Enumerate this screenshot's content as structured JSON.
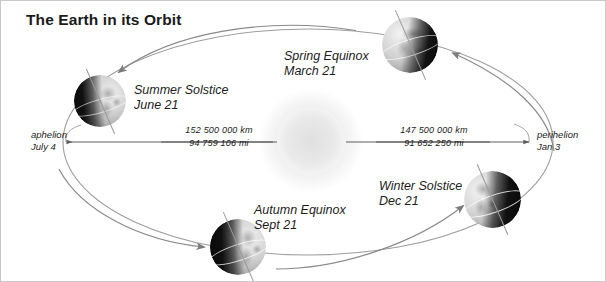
{
  "title": "The Earth in its Orbit",
  "colors": {
    "text": "#1c1c1c",
    "title": "#1a1a1a",
    "orbit_line": "#9a9a9a",
    "arrow": "#6e6e6e",
    "sun_glow": "#ededed",
    "border": "#c8c8c8",
    "globe_light": "#d8d8d8",
    "globe_dark": "#121212"
  },
  "sun": {
    "name": "sun",
    "cx": 310,
    "cy": 140,
    "radius": 52
  },
  "orbit": {
    "cx": 307,
    "cy": 141,
    "rx": 245,
    "ry": 113,
    "direction": "counterclockwise"
  },
  "positions": [
    {
      "id": "spring-equinox",
      "line1": "Spring Equinox",
      "line2": "March 21",
      "label_x": 283,
      "label_y": 48,
      "globe_x": 381,
      "globe_y": 16,
      "globe_size": 56,
      "lit_side": "left",
      "axis_tilt": -23.5
    },
    {
      "id": "summer-solstice",
      "line1": "Summer Solstice",
      "line2": "June 21",
      "label_x": 133,
      "label_y": 82,
      "globe_x": 73,
      "globe_y": 74,
      "globe_size": 52,
      "lit_side": "right",
      "axis_tilt": -23.5
    },
    {
      "id": "autumn-equinox",
      "line1": "Autumn Equinox",
      "line2": "Sept 21",
      "label_x": 253,
      "label_y": 202,
      "globe_x": 209,
      "globe_y": 218,
      "globe_size": 56,
      "lit_side": "right",
      "axis_tilt": -23.5
    },
    {
      "id": "winter-solstice",
      "line1": "Winter Solstice",
      "line2": "Dec 21",
      "label_x": 378,
      "label_y": 178,
      "globe_x": 463,
      "globe_y": 170,
      "globe_size": 57,
      "lit_side": "left",
      "axis_tilt": -23.5
    }
  ],
  "apsides": [
    {
      "id": "aphelion",
      "line1": "aphelion",
      "line2": "July 4",
      "x": 30,
      "y": 128
    },
    {
      "id": "perihelion",
      "line1": "perihelion",
      "line2": "Jan 3",
      "x": 536,
      "y": 128
    }
  ],
  "distances": [
    {
      "id": "aphelion-distance",
      "km": "152 500 000 km",
      "mi": "94 759 106 mi",
      "x": 163,
      "y": 124,
      "width": 110
    },
    {
      "id": "perihelion-distance",
      "km": "147 500 000 km",
      "mi": "91 652 250 mi",
      "x": 378,
      "y": 124,
      "width": 110
    }
  ]
}
